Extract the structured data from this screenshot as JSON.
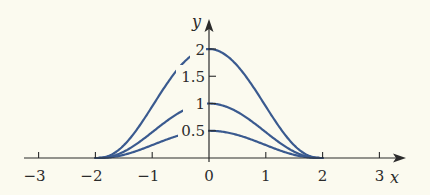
{
  "chart_data": {
    "type": "line",
    "title": "",
    "xlabel": "x",
    "ylabel": "y",
    "xlim": [
      -3,
      3
    ],
    "ylim": [
      0,
      2
    ],
    "x_ticks": [
      -3,
      -2,
      -1,
      0,
      1,
      2,
      3
    ],
    "x_tick_labels": [
      "−3",
      "−2",
      "−1",
      "0",
      "1",
      "2",
      "3"
    ],
    "y_ticks": [
      0.5,
      1,
      1.5,
      2
    ],
    "y_tick_labels": [
      "0.5",
      "1",
      "1.5",
      "2"
    ],
    "grid": false,
    "legend": null,
    "support": [
      -2,
      2
    ],
    "series": [
      {
        "name": "peak 2",
        "peak": 2,
        "x": [
          -2,
          -1.5,
          -1,
          -0.5,
          0,
          0.5,
          1,
          1.5,
          2
        ],
        "values": [
          0,
          0.24,
          0.84,
          1.6,
          2,
          1.6,
          0.84,
          0.24,
          0
        ]
      },
      {
        "name": "peak 1",
        "peak": 1,
        "x": [
          -2,
          -1.5,
          -1,
          -0.5,
          0,
          0.5,
          1,
          1.5,
          2
        ],
        "values": [
          0,
          0.12,
          0.46,
          0.8,
          1,
          0.8,
          0.46,
          0.12,
          0
        ]
      },
      {
        "name": "peak 0.5",
        "peak": 0.5,
        "x": [
          -2,
          -1.5,
          -1,
          -0.5,
          0,
          0.5,
          1,
          1.5,
          2
        ],
        "values": [
          0,
          0.06,
          0.23,
          0.4,
          0.5,
          0.4,
          0.23,
          0.06,
          0
        ]
      }
    ],
    "colors": {
      "curve": "#3a5a8f",
      "axis": "#2b2b2b",
      "background": "#fbfaef"
    }
  }
}
